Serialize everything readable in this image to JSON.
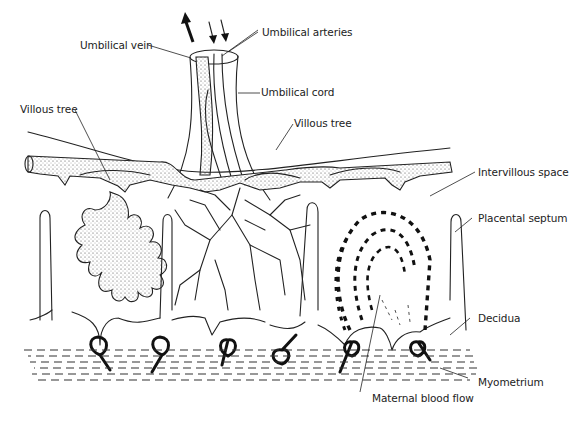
{
  "figure": {
    "labels": {
      "umbilical_arteries": "Umbilical arteries",
      "umbilical_vein": "Umbilical vein",
      "umbilical_cord": "Umbilical cord",
      "villous_tree_left": "Villous tree",
      "villous_tree_center": "Villous tree",
      "intervillous_space": "Intervillous space",
      "placental_septum": "Placental septum",
      "decidua": "Decidua",
      "myometrium": "Myometrium",
      "maternal_blood_flow": "Maternal blood flow"
    },
    "colors": {
      "line": "#222222",
      "background": "#ffffff"
    }
  }
}
